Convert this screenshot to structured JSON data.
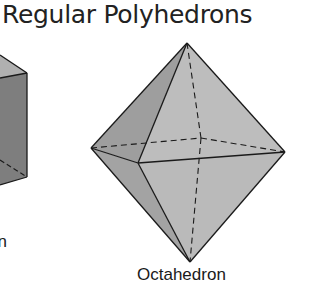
{
  "title": "Regular Polyhedrons",
  "shapes": [
    {
      "name": "Cube",
      "label_visible": "on",
      "partially_visible": true
    },
    {
      "name": "Octahedron",
      "label": "Octahedron"
    }
  ],
  "colors": {
    "face_light": "#bdbdbd",
    "face_mid": "#a6a6a6",
    "face_dark": "#8f8f8f",
    "edge": "#1a1a1a"
  }
}
